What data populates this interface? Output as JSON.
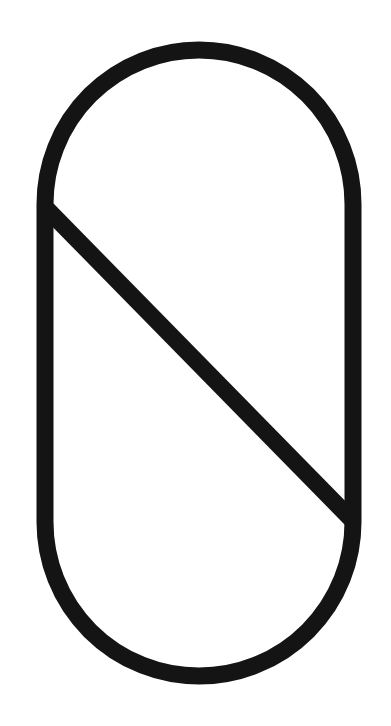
{
  "figure": {
    "stroke_color": "#141414",
    "background_color": "#ffffff",
    "stroke_width": 17,
    "shapes": [
      {
        "type": "stadium",
        "cx": 199,
        "top": 50,
        "bottom": 676,
        "radius": 154
      },
      {
        "type": "line",
        "x1": 45,
        "y1": 207,
        "x2": 353,
        "y2": 521
      }
    ]
  }
}
